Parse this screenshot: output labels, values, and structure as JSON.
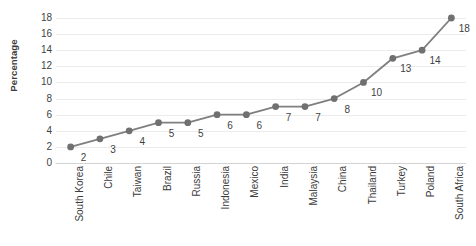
{
  "chart_data": {
    "type": "line",
    "title": "",
    "subtitle": "",
    "xlabel": "",
    "ylabel": "Percentage",
    "ylim": [
      0,
      18
    ],
    "ytick_step": 2,
    "yticks": [
      18,
      16,
      14,
      12,
      10,
      8,
      6,
      4,
      2,
      0
    ],
    "grid": true,
    "legend": "none",
    "show_data_labels": true,
    "marker": "circle",
    "categories": [
      "South Korea",
      "Chile",
      "Taiwan",
      "Brazil",
      "Russia",
      "Indonesia",
      "Mexico",
      "India",
      "Malaysia",
      "China",
      "Thailand",
      "Turkey",
      "Poland",
      "South Africa"
    ],
    "values": [
      2,
      3,
      4,
      5,
      5,
      6,
      6,
      7,
      7,
      8,
      10,
      13,
      14,
      18
    ],
    "data_labels": [
      "2",
      "3",
      "4",
      "5",
      "5",
      "6",
      "6",
      "7",
      "7",
      "8",
      "10",
      "13",
      "14",
      "18"
    ],
    "colors": {
      "line": "#7f7f7f",
      "marker": "#707070",
      "gridline": "#ebebeb",
      "axis": "#d3d3d3",
      "text": "#3f3f3f",
      "background": "#ffffff"
    }
  }
}
